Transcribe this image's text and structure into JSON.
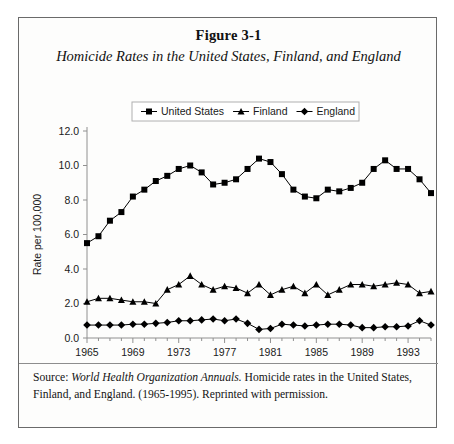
{
  "figure": {
    "number": "Figure 3-1",
    "title": "Homicide Rates in the United States, Finland, and England",
    "source_prefix": "Source: ",
    "source_italic": "World Health Organization Annuals.",
    "source_rest": " Homicide rates in the United States, Finland, and England. (1965-1995). Reprinted with permission."
  },
  "chart_data": {
    "type": "line",
    "title": "Homicide Rates in the United States, Finland, and England",
    "xlabel": "Year",
    "ylabel": "Rate per 100,000",
    "xlim": [
      1965,
      1995
    ],
    "ylim": [
      0.0,
      12.0
    ],
    "yticks": [
      "0.0",
      "2.0",
      "4.0",
      "6.0",
      "8.0",
      "10.0",
      "12.0"
    ],
    "ytick_values": [
      0.0,
      2.0,
      4.0,
      6.0,
      8.0,
      10.0,
      12.0
    ],
    "xticks": [
      "1965",
      "1969",
      "1973",
      "1977",
      "1981",
      "1985",
      "1989",
      "1993"
    ],
    "xtick_values": [
      1965,
      1969,
      1973,
      1977,
      1981,
      1985,
      1989,
      1993
    ],
    "grid": false,
    "legend_position": "top-center",
    "x": [
      1965,
      1966,
      1967,
      1968,
      1969,
      1970,
      1971,
      1972,
      1973,
      1974,
      1975,
      1976,
      1977,
      1978,
      1979,
      1980,
      1981,
      1982,
      1983,
      1984,
      1985,
      1986,
      1987,
      1988,
      1989,
      1990,
      1991,
      1992,
      1993,
      1994,
      1995
    ],
    "series": [
      {
        "name": "United States",
        "marker": "square",
        "color": "#000000",
        "values": [
          5.5,
          5.9,
          6.8,
          7.3,
          8.2,
          8.6,
          9.1,
          9.4,
          9.8,
          10.0,
          9.6,
          8.9,
          9.0,
          9.2,
          9.8,
          10.4,
          10.2,
          9.5,
          8.6,
          8.2,
          8.1,
          8.6,
          8.5,
          8.7,
          9.0,
          9.8,
          10.3,
          9.8,
          9.8,
          9.2,
          8.4
        ]
      },
      {
        "name": "Finland",
        "marker": "triangle",
        "color": "#000000",
        "values": [
          2.1,
          2.3,
          2.3,
          2.2,
          2.1,
          2.1,
          2.0,
          2.8,
          3.1,
          3.6,
          3.1,
          2.8,
          3.0,
          2.9,
          2.6,
          3.1,
          2.5,
          2.8,
          3.0,
          2.6,
          3.1,
          2.5,
          2.8,
          3.1,
          3.1,
          3.0,
          3.1,
          3.2,
          3.1,
          2.6,
          2.7
        ]
      },
      {
        "name": "England",
        "marker": "diamond",
        "color": "#000000",
        "values": [
          0.75,
          0.75,
          0.75,
          0.75,
          0.8,
          0.8,
          0.85,
          0.9,
          1.0,
          1.0,
          1.05,
          1.1,
          1.0,
          1.1,
          0.85,
          0.5,
          0.55,
          0.8,
          0.75,
          0.7,
          0.75,
          0.8,
          0.8,
          0.75,
          0.6,
          0.6,
          0.65,
          0.65,
          0.7,
          1.0,
          0.75
        ]
      }
    ],
    "legend": [
      {
        "label": "United States",
        "marker": "square"
      },
      {
        "label": "Finland",
        "marker": "triangle"
      },
      {
        "label": "England",
        "marker": "diamond"
      }
    ]
  }
}
